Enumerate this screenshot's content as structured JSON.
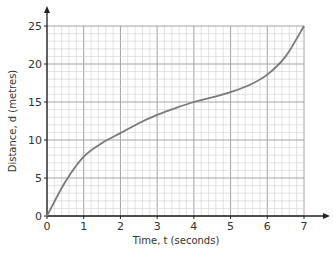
{
  "chart_data": {
    "type": "line",
    "title": "",
    "xlabel": "Time, t (seconds)",
    "ylabel": "Distance, d (metres)",
    "xlim": [
      0,
      7
    ],
    "ylim": [
      0,
      25
    ],
    "x_ticks": [
      "0",
      "1",
      "2",
      "3",
      "4",
      "5",
      "6",
      "7"
    ],
    "y_ticks": [
      "0",
      "5",
      "10",
      "15",
      "20",
      "25"
    ],
    "grid": true,
    "grid_minor_x": 0.2,
    "grid_minor_y": 1,
    "series": [
      {
        "name": "distance",
        "x": [
          0,
          0.5,
          1,
          1.5,
          2,
          2.5,
          3,
          3.5,
          4,
          4.5,
          5,
          5.5,
          6,
          6.5,
          7
        ],
        "values": [
          0,
          4.5,
          7.8,
          9.6,
          10.9,
          12.2,
          13.3,
          14.2,
          15.0,
          15.6,
          16.3,
          17.2,
          18.6,
          21.0,
          25.0
        ]
      }
    ],
    "colors": {
      "curve": "#7a7a7a",
      "grid_major": "#9a9a9a",
      "grid_minor": "#cfcfcf",
      "axis": "#222222"
    }
  }
}
